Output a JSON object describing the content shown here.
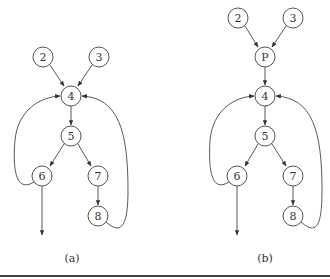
{
  "figure": {
    "panels": [
      {
        "caption": "(a)",
        "nodes": [
          {
            "id": "2",
            "label": "2",
            "x": 43,
            "y": 57
          },
          {
            "id": "3",
            "label": "3",
            "x": 99,
            "y": 57
          },
          {
            "id": "4",
            "label": "4",
            "x": 71,
            "y": 96
          },
          {
            "id": "5",
            "label": "5",
            "x": 71,
            "y": 136
          },
          {
            "id": "6",
            "label": "6",
            "x": 42,
            "y": 176
          },
          {
            "id": "7",
            "label": "7",
            "x": 98,
            "y": 176
          },
          {
            "id": "8",
            "label": "8",
            "x": 98,
            "y": 216
          }
        ],
        "edges": [
          {
            "from": "2",
            "to": "4"
          },
          {
            "from": "3",
            "to": "4"
          },
          {
            "from": "4",
            "to": "5"
          },
          {
            "from": "5",
            "to": "6"
          },
          {
            "from": "5",
            "to": "7"
          },
          {
            "from": "7",
            "to": "8"
          },
          {
            "from": "6",
            "to": "4",
            "type": "back-edge"
          },
          {
            "from": "8",
            "to": "4",
            "type": "back-edge"
          },
          {
            "from": "6",
            "to": "exit"
          }
        ]
      },
      {
        "caption": "(b)",
        "nodes": [
          {
            "id": "2",
            "label": "2",
            "x": 238,
            "y": 18
          },
          {
            "id": "3",
            "label": "3",
            "x": 293,
            "y": 18
          },
          {
            "id": "P",
            "label": "P",
            "x": 265,
            "y": 57
          },
          {
            "id": "4",
            "label": "4",
            "x": 265,
            "y": 96
          },
          {
            "id": "5",
            "label": "5",
            "x": 265,
            "y": 136
          },
          {
            "id": "6",
            "label": "6",
            "x": 237,
            "y": 176
          },
          {
            "id": "7",
            "label": "7",
            "x": 293,
            "y": 176
          },
          {
            "id": "8",
            "label": "8",
            "x": 293,
            "y": 216
          }
        ],
        "edges": [
          {
            "from": "2",
            "to": "P"
          },
          {
            "from": "3",
            "to": "P"
          },
          {
            "from": "P",
            "to": "4"
          },
          {
            "from": "4",
            "to": "5"
          },
          {
            "from": "5",
            "to": "6"
          },
          {
            "from": "5",
            "to": "7"
          },
          {
            "from": "7",
            "to": "8"
          },
          {
            "from": "6",
            "to": "4",
            "type": "back-edge"
          },
          {
            "from": "8",
            "to": "4",
            "type": "back-edge"
          },
          {
            "from": "6",
            "to": "exit"
          }
        ]
      }
    ]
  }
}
